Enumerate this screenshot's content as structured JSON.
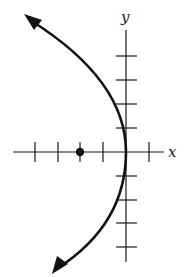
{
  "diagram": {
    "type": "parabola-graph",
    "equation": "y^2 = -8x",
    "axes": {
      "x_label": "x",
      "y_label": "y",
      "tick_spacing_units": 1,
      "x_ticks": [
        -5,
        -4,
        -3,
        -2,
        -1,
        1
      ],
      "y_ticks": [
        4,
        3,
        2,
        1,
        -1,
        -2,
        -3,
        -4
      ]
    },
    "vertex": [
      0,
      0
    ],
    "focus": [
      -2,
      0
    ],
    "opens": "left",
    "colors": {
      "curve": "#111111",
      "axes": "#1a1a1a",
      "background": "#ffffff"
    }
  }
}
